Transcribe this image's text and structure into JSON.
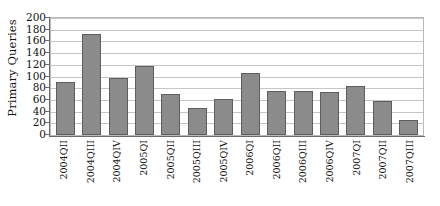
{
  "chart_data": {
    "type": "bar",
    "title": "",
    "xlabel": "",
    "ylabel": "Primary Queries",
    "ylim": [
      0,
      200
    ],
    "ytick_step": 20,
    "yticks": [
      0,
      20,
      40,
      60,
      80,
      100,
      120,
      140,
      160,
      180,
      200
    ],
    "ytick_labels": [
      "0",
      "20",
      "40",
      "60",
      "80",
      "100",
      "120",
      "140",
      "160",
      "180",
      "200"
    ],
    "grid": true,
    "grid_axis": "y",
    "legend": false,
    "legend_position": "none",
    "categories": [
      "2004QII",
      "2004QIII",
      "2004QIV",
      "2005QI",
      "2005QII",
      "2005QIII",
      "2005QIV",
      "2006QI",
      "2006QII",
      "2006QIII",
      "2006QIV",
      "2007QI",
      "2007QII",
      "2007QIII"
    ],
    "values": [
      90,
      172,
      98,
      118,
      70,
      47,
      61,
      106,
      75,
      76,
      73,
      83,
      59,
      25
    ],
    "bar_color": "#8b8b8b",
    "bar_edge_color": "#5e5e5e",
    "grid_color": "#c6c6c6",
    "axis_color": "#6a6a6a",
    "background_color": "#ffffff",
    "text_color": "#141414",
    "xtick_rotation": 90
  }
}
